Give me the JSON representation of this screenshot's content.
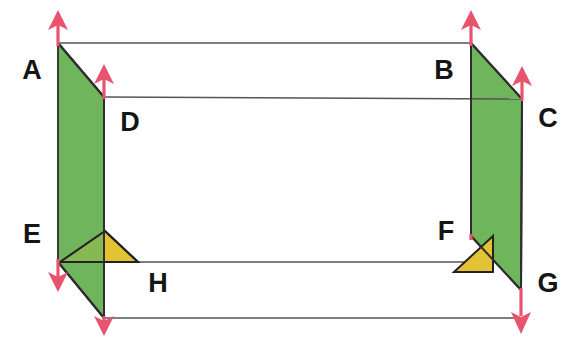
{
  "diagram": {
    "type": "geometric-solid-diagram",
    "canvas": {
      "width": 572,
      "height": 340,
      "background": "#ffffff"
    },
    "colors": {
      "green_fill": "#6eb55c",
      "yellow_fill": "#e3c234",
      "edge_stroke": "#3a3a3a",
      "thin_edge_stroke": "#555555",
      "arrow_stroke": "#e8546e",
      "label_color": "#151515"
    },
    "vertices": [
      {
        "name": "A",
        "label": "A",
        "point": [
          58,
          43
        ],
        "label_pos": [
          32,
          72
        ]
      },
      {
        "name": "B",
        "label": "B",
        "point": [
          471,
          43
        ],
        "label_pos": [
          444,
          72
        ]
      },
      {
        "name": "C",
        "label": "C",
        "point": [
          522,
          99
        ],
        "label_pos": [
          548,
          120
        ]
      },
      {
        "name": "D",
        "label": "D",
        "point": [
          104,
          97
        ],
        "label_pos": [
          130,
          124
        ]
      },
      {
        "name": "E",
        "label": "E",
        "point": [
          58,
          262
        ],
        "label_pos": [
          32,
          236
        ]
      },
      {
        "name": "F",
        "label": "F",
        "point": [
          471,
          236
        ],
        "label_pos": [
          446,
          233
        ]
      },
      {
        "name": "G",
        "label": "G",
        "point": [
          521,
          290
        ],
        "label_pos": [
          548,
          285
        ]
      },
      {
        "name": "H",
        "label": "H",
        "point": [
          104,
          318
        ],
        "label_pos": [
          158,
          285
        ]
      }
    ],
    "faces": [
      {
        "name": "left-face",
        "fill": "green",
        "points": "58,43 104,97 104,318 58,262"
      },
      {
        "name": "right-face",
        "fill": "green",
        "points": "471,43 522,99 521,290 471,236"
      },
      {
        "name": "triangle-H",
        "fill": "yellow",
        "points": "60,262 138,262 105,231"
      },
      {
        "name": "triangle-F",
        "fill": "yellow",
        "points": "454,272 493,272 493,236"
      }
    ],
    "arrows": [
      {
        "name": "arrow-A",
        "direction": "up",
        "from": [
          58,
          45
        ],
        "to": [
          58,
          12
        ]
      },
      {
        "name": "arrow-D",
        "direction": "up",
        "from": [
          104,
          99
        ],
        "to": [
          104,
          66
        ]
      },
      {
        "name": "arrow-B",
        "direction": "up",
        "from": [
          471,
          45
        ],
        "to": [
          471,
          12
        ]
      },
      {
        "name": "arrow-C",
        "direction": "up",
        "from": [
          522,
          101
        ],
        "to": [
          522,
          68
        ]
      },
      {
        "name": "arrow-E",
        "direction": "down",
        "from": [
          58,
          260
        ],
        "to": [
          58,
          290
        ]
      },
      {
        "name": "arrow-H",
        "direction": "down",
        "from": [
          104,
          316
        ],
        "to": [
          104,
          332
        ]
      },
      {
        "name": "arrow-F",
        "direction": "down",
        "from": [
          471,
          234
        ],
        "to": [
          471,
          246
        ]
      },
      {
        "name": "arrow-G",
        "direction": "down",
        "from": [
          521,
          288
        ],
        "to": [
          521,
          330
        ]
      }
    ],
    "edges": [
      {
        "name": "edge-A-B",
        "from": [
          58,
          43
        ],
        "to": [
          471,
          43
        ],
        "weight": "thin"
      },
      {
        "name": "edge-A-D",
        "from": [
          58,
          43
        ],
        "to": [
          104,
          97
        ],
        "weight": "bold"
      },
      {
        "name": "edge-D-C",
        "from": [
          104,
          97
        ],
        "to": [
          522,
          99
        ],
        "weight": "thin"
      },
      {
        "name": "edge-B-C",
        "from": [
          471,
          43
        ],
        "to": [
          522,
          99
        ],
        "weight": "bold"
      },
      {
        "name": "edge-A-E",
        "from": [
          58,
          43
        ],
        "to": [
          58,
          262
        ],
        "weight": "bold"
      },
      {
        "name": "edge-D-H",
        "from": [
          104,
          97
        ],
        "to": [
          104,
          318
        ],
        "weight": "bold"
      },
      {
        "name": "edge-B-F",
        "from": [
          471,
          43
        ],
        "to": [
          471,
          236
        ],
        "weight": "bold"
      },
      {
        "name": "edge-C-G",
        "from": [
          522,
          99
        ],
        "to": [
          521,
          290
        ],
        "weight": "bold"
      },
      {
        "name": "edge-E-H",
        "from": [
          58,
          262
        ],
        "to": [
          104,
          318
        ],
        "weight": "bold"
      },
      {
        "name": "edge-E-F",
        "from": [
          58,
          262
        ],
        "to": [
          471,
          262
        ],
        "weight": "thin"
      },
      {
        "name": "edge-H-G",
        "from": [
          104,
          318
        ],
        "to": [
          521,
          318
        ],
        "weight": "thin"
      },
      {
        "name": "edge-F-G",
        "from": [
          471,
          236
        ],
        "to": [
          521,
          290
        ],
        "weight": "bold"
      }
    ]
  }
}
